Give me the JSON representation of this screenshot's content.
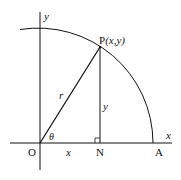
{
  "diagram": {
    "type": "unit-circle-polar-coordinates",
    "axes": {
      "x_label": "x",
      "y_label": "y"
    },
    "points": {
      "origin": "O",
      "foot": "N",
      "arc_end": "A",
      "point": "P",
      "point_coords": "(x,y)"
    },
    "segments": {
      "radius_label": "r",
      "vertical_label": "y",
      "horizontal_label": "x"
    },
    "angle_label": "θ",
    "colors": {
      "stroke": "#111111",
      "background": "#ffffff"
    }
  }
}
